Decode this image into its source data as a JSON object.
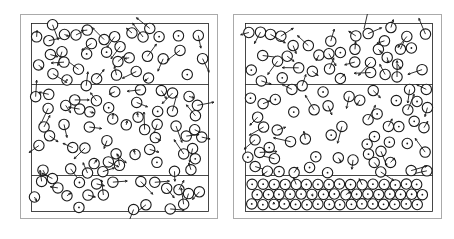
{
  "figure": {
    "title": "",
    "caption": "",
    "background_color": "#ffffff",
    "ink_color": "#1a1a1a",
    "frame_color": "#aaaaaa",
    "width": 454,
    "height": 239,
    "panel_count": 2
  },
  "panels": [
    {
      "id": "panel-left",
      "label": "",
      "frame": {
        "x": 20,
        "y": 14,
        "width": 198,
        "height": 205
      },
      "box": {
        "x": 11,
        "y": 9,
        "width": 177,
        "height": 188
      },
      "dividers_y": [
        61,
        152
      ],
      "description": "disordered particle configuration with velocity arrows throughout",
      "ordered_bottom_band": false
    },
    {
      "id": "panel-right",
      "label": "",
      "frame": {
        "x": 233,
        "y": 14,
        "width": 209,
        "height": 205
      },
      "box": {
        "x": 12,
        "y": 9,
        "width": 187,
        "height": 188
      },
      "dividers_y": [
        61,
        152
      ],
      "description": "partially crystallized configuration; lower band shows ordered particles with small center dots and few arrows",
      "ordered_bottom_band": true
    }
  ],
  "chart_data": {
    "type": "scatter",
    "title": "",
    "subtitle": "",
    "xlabel": "",
    "ylabel": "",
    "legend": [],
    "grid": false,
    "axis_visible": false,
    "marker": {
      "shape": "circle-outline",
      "radius_px": 5.2,
      "stroke_width_px": 1.1,
      "center_dot_radius_px": 0.9,
      "stroke_color": "#1a1a1a",
      "fill_color": "#ffffff"
    },
    "vector_overlay": {
      "enabled": true,
      "name": "velocity-arrows",
      "stroke_color": "#1a1a1a",
      "stroke_width_px": 0.9,
      "typical_length_px": 11,
      "max_length_px": 26,
      "arrowhead": "line"
    },
    "series": [
      {
        "name": "panel-left-particles",
        "panel": "panel-left",
        "count": 242,
        "xlim": [
          0,
          177
        ],
        "ylim": [
          0,
          188
        ],
        "seed": 1741,
        "layout": "random-jammed",
        "arrow_fraction": 0.86,
        "bands": [
          {
            "y0": 0,
            "y1": 61,
            "order": "disordered",
            "arrow_fraction": 0.9
          },
          {
            "y0": 61,
            "y1": 152,
            "order": "disordered",
            "arrow_fraction": 0.88
          },
          {
            "y0": 152,
            "y1": 188,
            "order": "disordered",
            "arrow_fraction": 0.82
          }
        ]
      },
      {
        "name": "panel-right-particles",
        "panel": "panel-right",
        "count": 246,
        "xlim": [
          0,
          187
        ],
        "ylim": [
          0,
          188
        ],
        "seed": 9025,
        "layout": "random-jammed-with-crystal-base",
        "arrow_fraction": 0.58,
        "bands": [
          {
            "y0": 0,
            "y1": 61,
            "order": "disordered",
            "arrow_fraction": 0.8
          },
          {
            "y0": 61,
            "y1": 152,
            "order": "disordered",
            "arrow_fraction": 0.66
          },
          {
            "y0": 152,
            "y1": 188,
            "order": "hexagonal",
            "arrow_fraction": 0.1
          }
        ],
        "annotations": [
          {
            "name": "escaping-particle-arrow",
            "x": 119,
            "y": 6,
            "dx": 5,
            "dy": -22,
            "note": "long arrow extending above top wall"
          }
        ]
      }
    ]
  }
}
